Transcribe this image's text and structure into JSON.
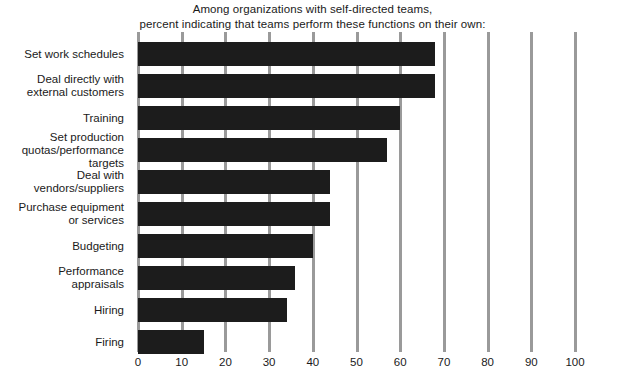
{
  "chart_data": {
    "type": "bar",
    "orientation": "horizontal",
    "title": "Among organizations with self-directed teams,\npercent indicating that teams perform these functions on their own:",
    "title_lines": [
      "Among organizations with self-directed teams,",
      "percent indicating that teams perform these functions on their own:"
    ],
    "xlabel": "",
    "ylabel": "",
    "xlim": [
      0,
      100
    ],
    "xticks": [
      0,
      10,
      20,
      30,
      40,
      50,
      60,
      70,
      80,
      90,
      100
    ],
    "xtick_labels": [
      "0",
      "10",
      "20",
      "30",
      "40",
      "50",
      "60",
      "70",
      "80",
      "90",
      "100"
    ],
    "grid": true,
    "grid_axis": "x",
    "legend": false,
    "categories": [
      "Set work schedules",
      "Deal directly with\nexternal customers",
      "Training",
      "Set production\nquotas/performance\ntargets",
      "Deal with\nvendors/suppliers",
      "Purchase equipment\nor services",
      "Budgeting",
      "Performance\nappraisals",
      "Hiring",
      "Firing"
    ],
    "values": [
      68,
      68,
      60,
      57,
      44,
      44,
      40,
      36,
      34,
      15
    ],
    "bar_color": "#1c1c1c",
    "grid_color": "#9a9a9a",
    "background_color": "#ffffff",
    "text_color": "#1a1a1a"
  }
}
